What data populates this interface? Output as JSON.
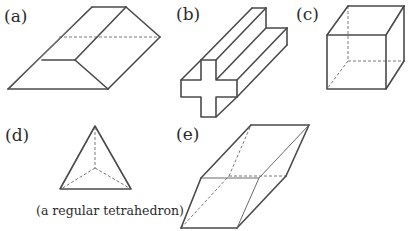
{
  "figure": {
    "labels": {
      "a": "(a)",
      "b": "(b)",
      "c": "(c)",
      "d": "(d)",
      "e": "(e)"
    },
    "captions": {
      "d": "(a regular tetrahedron)"
    },
    "shapes": [
      {
        "id": "a",
        "name": "triangular-prism-like solid"
      },
      {
        "id": "b",
        "name": "cross-section prism"
      },
      {
        "id": "c",
        "name": "cube"
      },
      {
        "id": "d",
        "name": "regular tetrahedron"
      },
      {
        "id": "e",
        "name": "parallelepiped"
      }
    ],
    "colors": {
      "line": "#4a4a4a",
      "hidden": "#7a7a7a",
      "background": "#ffffff"
    }
  }
}
